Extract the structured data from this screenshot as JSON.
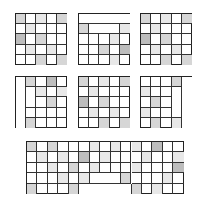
{
  "figure": {
    "shade_colors": {
      "light": "#e8e8e8",
      "mid": "#d6d6d6",
      "dark": "#bdbdbd"
    },
    "grids": [
      {
        "id": "grid-1",
        "x": 15,
        "y": 13,
        "cols": 5,
        "rows": 5,
        "cell": 10.2,
        "shaded": [
          [
            0,
            0,
            "mid"
          ],
          [
            0,
            2,
            "light"
          ],
          [
            0,
            4,
            "mid"
          ],
          [
            1,
            1,
            "light"
          ],
          [
            2,
            0,
            "dark"
          ],
          [
            2,
            2,
            "mid"
          ],
          [
            3,
            1,
            "light"
          ],
          [
            3,
            3,
            "light"
          ],
          [
            4,
            2,
            "mid"
          ],
          [
            4,
            4,
            "mid"
          ]
        ],
        "merged": []
      },
      {
        "id": "grid-2",
        "x": 78,
        "y": 13,
        "cols": 5,
        "rows": 5,
        "cell": 10.2,
        "shaded": [
          [
            1,
            0,
            "mid"
          ],
          [
            1,
            4,
            "light"
          ],
          [
            2,
            3,
            "light"
          ],
          [
            3,
            2,
            "mid"
          ],
          [
            3,
            4,
            "dark"
          ],
          [
            4,
            3,
            "light"
          ]
        ],
        "merged": [
          [
            0,
            0,
            1,
            5
          ],
          [
            1,
            1,
            1,
            3
          ]
        ]
      },
      {
        "id": "grid-3",
        "x": 140,
        "y": 13,
        "cols": 5,
        "rows": 5,
        "cell": 10.2,
        "shaded": [
          [
            0,
            0,
            "mid"
          ],
          [
            0,
            2,
            "light"
          ],
          [
            0,
            4,
            "mid"
          ],
          [
            1,
            1,
            "light"
          ],
          [
            2,
            0,
            "dark"
          ],
          [
            2,
            2,
            "mid"
          ],
          [
            3,
            1,
            "light"
          ],
          [
            3,
            3,
            "light"
          ],
          [
            4,
            2,
            "mid"
          ],
          [
            4,
            4,
            "mid"
          ]
        ],
        "merged": []
      },
      {
        "id": "grid-4",
        "x": 15,
        "y": 76,
        "cols": 5,
        "rows": 5,
        "cell": 10.2,
        "shaded": [
          [
            0,
            1,
            "mid"
          ],
          [
            0,
            3,
            "dark"
          ],
          [
            1,
            2,
            "light"
          ],
          [
            1,
            4,
            "light"
          ],
          [
            2,
            3,
            "mid"
          ],
          [
            4,
            1,
            "mid"
          ]
        ],
        "merged": [
          [
            0,
            0,
            5,
            1
          ],
          [
            1,
            1,
            2,
            1
          ]
        ]
      },
      {
        "id": "grid-5",
        "x": 78,
        "y": 76,
        "cols": 5,
        "rows": 5,
        "cell": 10.2,
        "shaded": [
          [
            0,
            0,
            "mid"
          ],
          [
            0,
            2,
            "light"
          ],
          [
            0,
            4,
            "mid"
          ],
          [
            1,
            1,
            "light"
          ],
          [
            2,
            0,
            "dark"
          ],
          [
            2,
            2,
            "mid"
          ],
          [
            3,
            1,
            "light"
          ],
          [
            3,
            3,
            "light"
          ],
          [
            4,
            2,
            "mid"
          ],
          [
            4,
            4,
            "mid"
          ]
        ],
        "merged": []
      },
      {
        "id": "grid-6",
        "x": 140,
        "y": 76,
        "cols": 5,
        "rows": 5,
        "cell": 10.2,
        "shaded": [
          [
            0,
            3,
            "mid"
          ],
          [
            1,
            0,
            "light"
          ],
          [
            2,
            1,
            "mid"
          ],
          [
            3,
            0,
            "light"
          ],
          [
            4,
            1,
            "mid"
          ],
          [
            4,
            3,
            "light"
          ]
        ],
        "merged": [
          [
            0,
            4,
            5,
            1
          ],
          [
            1,
            3,
            3,
            1
          ]
        ]
      },
      {
        "id": "grid-7",
        "x": 26,
        "y": 141,
        "cols": 15,
        "rows": 5,
        "cell": 10.45,
        "shaded": [
          [
            0,
            0,
            "mid"
          ],
          [
            0,
            2,
            "mid"
          ],
          [
            0,
            6,
            "light"
          ],
          [
            0,
            8,
            "light"
          ],
          [
            0,
            10,
            "light"
          ],
          [
            0,
            12,
            "dark"
          ],
          [
            1,
            1,
            "light"
          ],
          [
            1,
            3,
            "light"
          ],
          [
            1,
            5,
            "dark"
          ],
          [
            1,
            7,
            "light"
          ],
          [
            1,
            11,
            "light"
          ],
          [
            1,
            14,
            "light"
          ],
          [
            2,
            2,
            "light"
          ],
          [
            2,
            4,
            "mid"
          ],
          [
            2,
            6,
            "light"
          ],
          [
            2,
            10,
            "light"
          ],
          [
            2,
            14,
            "dark"
          ],
          [
            3,
            3,
            "light"
          ],
          [
            3,
            5,
            "light"
          ],
          [
            3,
            9,
            "mid"
          ],
          [
            3,
            13,
            "light"
          ],
          [
            4,
            0,
            "mid"
          ],
          [
            4,
            4,
            "mid"
          ],
          [
            4,
            10,
            "mid"
          ],
          [
            4,
            12,
            "light"
          ]
        ],
        "merged": [
          [
            3,
            6,
            1,
            3
          ],
          [
            4,
            5,
            1,
            5
          ]
        ]
      }
    ]
  }
}
